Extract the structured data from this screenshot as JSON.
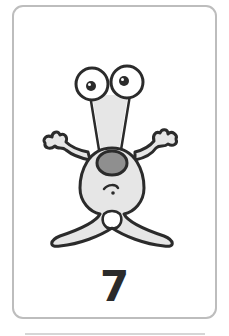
{
  "card": {
    "number": "7",
    "illustration": "alien-creature-icon",
    "colors": {
      "border": "#bdbdbd",
      "outline": "#2b2b2b",
      "body_fill": "#e6e6e6",
      "nose_fill": "#8f8f8f",
      "background": "#ffffff"
    }
  }
}
